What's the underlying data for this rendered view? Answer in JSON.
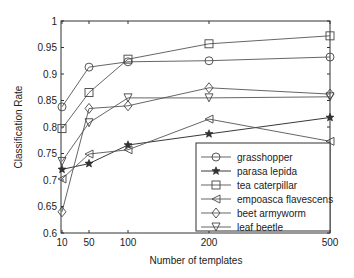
{
  "chart_data": {
    "type": "line",
    "title": "",
    "xlabel": "Number of templates",
    "ylabel": "Classification Rate",
    "x": [
      10,
      50,
      100,
      200,
      500
    ],
    "x_tick_labels": [
      "10",
      "50",
      "100",
      "200",
      "500"
    ],
    "y_tick_labels": [
      "0.6",
      "0.65",
      "0.7",
      "0.75",
      "0.8",
      "0.85",
      "0.9",
      "0.95",
      "1"
    ],
    "ylim": [
      0.6,
      1.0
    ],
    "grid": false,
    "legend_position": "lower right",
    "series": [
      {
        "name": "grasshopper",
        "marker": "circle",
        "values": [
          0.838,
          0.913,
          0.923,
          0.925,
          0.932
        ]
      },
      {
        "name": "parasa lepida",
        "marker": "star",
        "values": [
          0.72,
          0.731,
          0.766,
          0.787,
          0.818
        ]
      },
      {
        "name": "tea caterpillar",
        "marker": "square",
        "values": [
          0.797,
          0.865,
          0.928,
          0.957,
          0.972
        ]
      },
      {
        "name": "empoasca flavescens",
        "marker": "triangle-left",
        "values": [
          0.702,
          0.749,
          0.757,
          0.815,
          0.773
        ]
      },
      {
        "name": "beet armyworm",
        "marker": "diamond",
        "values": [
          0.64,
          0.835,
          0.84,
          0.874,
          0.862
        ]
      },
      {
        "name": "leaf beetle",
        "marker": "triangle-down",
        "values": [
          0.735,
          0.808,
          0.855,
          0.855,
          0.857
        ]
      }
    ]
  }
}
